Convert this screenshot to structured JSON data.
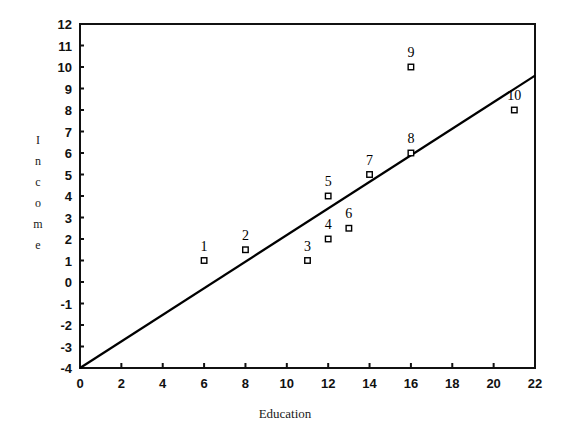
{
  "chart_data": {
    "type": "scatter",
    "title": "",
    "xlabel": "Education",
    "ylabel": "Income",
    "ylabel_letters": [
      "I",
      "n",
      "c",
      "o",
      "m",
      "e"
    ],
    "xlim": [
      0,
      22
    ],
    "ylim": [
      -4,
      12
    ],
    "grid": false,
    "legend": "none",
    "xticks": [
      0,
      2,
      4,
      6,
      8,
      10,
      12,
      14,
      16,
      18,
      20,
      22
    ],
    "xtick_labels": [
      "0",
      "2",
      "4",
      "6",
      "8",
      "10",
      "12",
      "14",
      "16",
      "18",
      "20",
      "22"
    ],
    "yticks": [
      -4,
      -3,
      -2,
      -1,
      0,
      1,
      2,
      3,
      4,
      5,
      6,
      7,
      8,
      9,
      10,
      11,
      12
    ],
    "ytick_labels": [
      "-4",
      "-3",
      "-2",
      "-1",
      "0",
      "1",
      "2",
      "3",
      "4",
      "5",
      "6",
      "7",
      "8",
      "9",
      "10",
      "11",
      "12"
    ],
    "points": [
      {
        "label": "1",
        "x": 6,
        "y": 1.0
      },
      {
        "label": "2",
        "x": 8,
        "y": 1.5
      },
      {
        "label": "3",
        "x": 11,
        "y": 1.0
      },
      {
        "label": "4",
        "x": 12,
        "y": 2.0
      },
      {
        "label": "5",
        "x": 12,
        "y": 4.0
      },
      {
        "label": "6",
        "x": 13,
        "y": 2.5
      },
      {
        "label": "7",
        "x": 14,
        "y": 5.0
      },
      {
        "label": "8",
        "x": 16,
        "y": 6.0
      },
      {
        "label": "9",
        "x": 16,
        "y": 10.0
      },
      {
        "label": "10",
        "x": 21,
        "y": 8.0
      }
    ],
    "fit_line": {
      "name": "regression-line",
      "x_start": 0,
      "y_start": -4.0,
      "x_end": 22,
      "y_end": 9.6,
      "slope": 0.618,
      "intercept": -4.0
    },
    "colors": {
      "axis": "#111111",
      "line": "#000000",
      "marker_fill": "#ffffff",
      "marker_stroke": "#000000",
      "background": "#ffffff"
    }
  }
}
